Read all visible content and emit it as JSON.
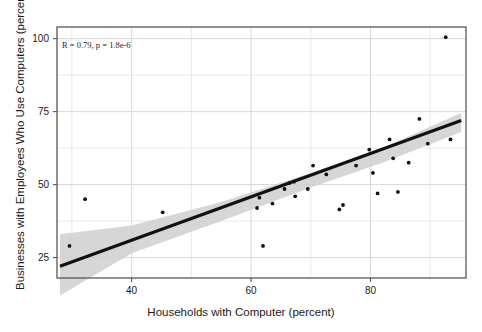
{
  "chart_data": {
    "type": "scatter",
    "title": "",
    "xlabel": "Households with Computer (percent)",
    "ylabel": "Businesses with Employees Who Use Computers (percent)",
    "xlim": [
      27.5,
      96.0
    ],
    "ylim": [
      18.0,
      104.0
    ],
    "xticks": [
      40,
      60,
      80
    ],
    "yticks": [
      25,
      50,
      75,
      100
    ],
    "xtick_labels": [
      "40",
      "60",
      "80"
    ],
    "ytick_labels": [
      "25",
      "50",
      "75",
      "100"
    ],
    "grid": true,
    "grid_minor": true,
    "legend": "none",
    "annotations": [
      {
        "text": "R = 0.79, p = 1.8e-6",
        "x": 30.5,
        "y": 95.0,
        "style": "italic-serif"
      }
    ],
    "annotation_r": "R = 0.79",
    "annotation_p": "p = 1.8e-6",
    "correlation_r": 0.79,
    "p_value": "1.8e-6",
    "point_color": "#111111",
    "line_color": "#111111",
    "band_color": "#cfcfcf",
    "grid_color": "#e3e3e3",
    "frame_color": "#4a4a4a",
    "points": [
      {
        "x": 29.6,
        "y": 29.0
      },
      {
        "x": 32.2,
        "y": 45.0
      },
      {
        "x": 45.2,
        "y": 40.5
      },
      {
        "x": 61.0,
        "y": 42.0
      },
      {
        "x": 61.4,
        "y": 45.5
      },
      {
        "x": 62.0,
        "y": 29.0
      },
      {
        "x": 63.6,
        "y": 43.5
      },
      {
        "x": 65.6,
        "y": 48.5
      },
      {
        "x": 66.4,
        "y": 50.5
      },
      {
        "x": 67.2,
        "y": 51.0
      },
      {
        "x": 67.4,
        "y": 46.0
      },
      {
        "x": 69.5,
        "y": 48.5
      },
      {
        "x": 70.4,
        "y": 56.5
      },
      {
        "x": 72.6,
        "y": 53.5
      },
      {
        "x": 74.8,
        "y": 41.5
      },
      {
        "x": 75.4,
        "y": 43.0
      },
      {
        "x": 77.6,
        "y": 56.5
      },
      {
        "x": 79.8,
        "y": 62.0
      },
      {
        "x": 80.4,
        "y": 54.0
      },
      {
        "x": 81.2,
        "y": 47.0
      },
      {
        "x": 83.2,
        "y": 65.5
      },
      {
        "x": 83.8,
        "y": 59.0
      },
      {
        "x": 84.6,
        "y": 47.5
      },
      {
        "x": 86.4,
        "y": 57.5
      },
      {
        "x": 88.2,
        "y": 72.5
      },
      {
        "x": 89.6,
        "y": 64.0
      },
      {
        "x": 92.6,
        "y": 100.5
      },
      {
        "x": 93.4,
        "y": 65.5
      }
    ],
    "regression_line": {
      "x_start": 28.0,
      "y_start": 22.0,
      "x_end": 95.2,
      "y_end": 72.0,
      "slope": 0.744,
      "intercept": 1.17
    },
    "confidence_band": {
      "upper": [
        {
          "x": 28.0,
          "y": 33.0
        },
        {
          "x": 40.0,
          "y": 36.0
        },
        {
          "x": 55.0,
          "y": 44.0
        },
        {
          "x": 70.0,
          "y": 54.0
        },
        {
          "x": 82.0,
          "y": 62.5
        },
        {
          "x": 95.2,
          "y": 74.5
        }
      ],
      "lower": [
        {
          "x": 28.0,
          "y": 12.0
        },
        {
          "x": 40.0,
          "y": 26.5
        },
        {
          "x": 55.0,
          "y": 37.5
        },
        {
          "x": 70.0,
          "y": 49.0
        },
        {
          "x": 82.0,
          "y": 57.5
        },
        {
          "x": 95.2,
          "y": 68.0
        }
      ]
    }
  }
}
